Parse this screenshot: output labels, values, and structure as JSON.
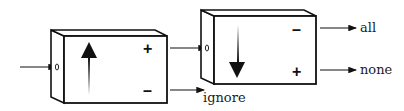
{
  "diagram": {
    "type": "two-stage filter chain",
    "box1": {
      "arrow_direction": "up",
      "top_sign": "+",
      "bottom_sign": "–"
    },
    "box2": {
      "arrow_direction": "down",
      "top_sign": "–",
      "bottom_sign": "+"
    },
    "outputs": {
      "box1_bottom": "ignore",
      "box2_top": "all",
      "box2_bottom": "none"
    }
  }
}
